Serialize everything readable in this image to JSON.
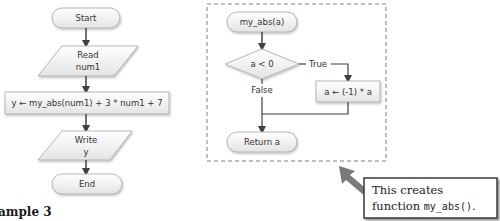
{
  "main_flowchart": {
    "start": "Start",
    "read_line1": "Read",
    "read_line2": "num1",
    "process": "y ← my_abs(num1) + 3 * num1 + 7",
    "write_line1": "Write",
    "write_line2": "y",
    "end": "End"
  },
  "function_flowchart": {
    "start": "my_abs(a)",
    "decision": "a < 0",
    "true_label": "True",
    "false_label": "False",
    "process": "a ← (-1) * a",
    "return": "Return a"
  },
  "callout": {
    "line1": "This creates",
    "line2_prefix": "function ",
    "line2_code": "my_abs()",
    "line2_suffix": "."
  },
  "caption": "ample 3",
  "colors": {
    "shape_fill_top": "#ffffff",
    "shape_fill_bottom": "#e6e6e6",
    "shape_stroke": "#a6a6a6",
    "arrow": "#404040",
    "dash_border": "#7f7f7f",
    "callout_border": "#3a3a3a",
    "callout_arrow": "#808080"
  }
}
